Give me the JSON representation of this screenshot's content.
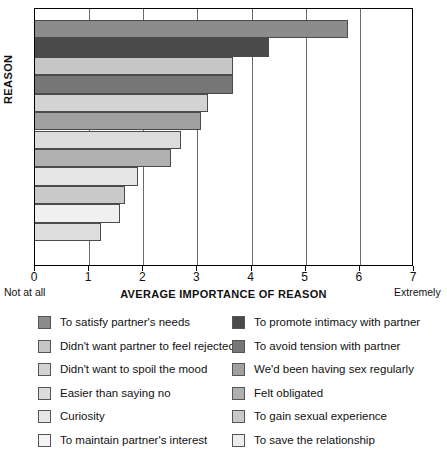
{
  "chart_data": {
    "type": "bar",
    "orientation": "horizontal",
    "title": "",
    "xlabel": "AVERAGE IMPORTANCE OF REASON",
    "ylabel": "REASON",
    "xlim": [
      0,
      7
    ],
    "xticks": [
      0,
      1,
      2,
      3,
      4,
      5,
      6,
      7
    ],
    "xtick_labels": [
      "0",
      "1",
      "2",
      "3",
      "4",
      "5",
      "6",
      "7"
    ],
    "x_axis_anchor_low": "Not at all",
    "x_axis_anchor_high": "Extremely",
    "grid": true,
    "legend_position": "below",
    "categories": [
      "To satisfy partner's needs",
      "To promote intimacy with partner",
      "Didn't want partner to feel rejected",
      "To avoid tension with partner",
      "Didn't want to spoil the mood",
      "We'd been having sex regularly",
      "Easier than saying no",
      "Felt obligated",
      "Curiosity",
      "To gain sexual experience",
      "To maintain partner's interest",
      "To save the relationship"
    ],
    "values": [
      5.78,
      4.32,
      3.66,
      3.66,
      3.19,
      3.07,
      2.7,
      2.51,
      1.9,
      1.66,
      1.57,
      1.22
    ],
    "colors": [
      "#8c8c8c",
      "#4a4a4a",
      "#c6c6c6",
      "#777777",
      "#d3d3d3",
      "#a0a0a0",
      "#dcdcdc",
      "#b0b0b0",
      "#e6e6e6",
      "#c9c9c9",
      "#f0f0f0",
      "#dedede"
    ]
  },
  "legend": {
    "left_column": [
      {
        "label": "To satisfy partner's needs",
        "color": "#8c8c8c"
      },
      {
        "label": "Didn't want partner to feel rejected",
        "color": "#c6c6c6"
      },
      {
        "label": "Didn't want to spoil the mood",
        "color": "#d3d3d3"
      },
      {
        "label": "Easier than saying no",
        "color": "#dcdcdc"
      },
      {
        "label": "Curiosity",
        "color": "#e6e6e6"
      },
      {
        "label": "To maintain partner's interest",
        "color": "#f4f4f4"
      }
    ],
    "right_column": [
      {
        "label": "To promote intimacy with partner",
        "color": "#4a4a4a"
      },
      {
        "label": "To avoid tension with partner",
        "color": "#777777"
      },
      {
        "label": "We'd been having sex regularly",
        "color": "#a0a0a0"
      },
      {
        "label": "Felt obligated",
        "color": "#b0b0b0"
      },
      {
        "label": "To gain sexual experience",
        "color": "#c9c9c9"
      },
      {
        "label": "To save the relationship",
        "color": "#ececec"
      }
    ]
  }
}
